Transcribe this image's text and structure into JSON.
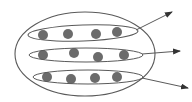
{
  "diagram": {
    "colors": {
      "background": "#ffffff",
      "stroke": "#5a5a5a",
      "dot": "#6b6b6b"
    },
    "outer_ellipse": {
      "cx": 85,
      "cy": 54,
      "rx": 70,
      "ry": 42
    },
    "groups": [
      {
        "ellipse": {
          "cx": 83,
          "cy": 33,
          "rx": 55,
          "ry": 8,
          "rotate": -2
        },
        "dots": [
          {
            "x": 43,
            "y": 35
          },
          {
            "x": 68,
            "y": 34
          },
          {
            "x": 96,
            "y": 34
          },
          {
            "x": 117,
            "y": 32
          }
        ],
        "arrow": {
          "x1": 136,
          "y1": 30,
          "x2": 172,
          "y2": 12
        }
      },
      {
        "ellipse": {
          "cx": 86,
          "cy": 55,
          "rx": 57,
          "ry": 7,
          "rotate": 0
        },
        "dots": [
          {
            "x": 43,
            "y": 55
          },
          {
            "x": 74,
            "y": 53
          },
          {
            "x": 98,
            "y": 57
          },
          {
            "x": 124,
            "y": 55
          }
        ],
        "arrow": {
          "x1": 142,
          "y1": 54,
          "x2": 180,
          "y2": 51
        }
      },
      {
        "ellipse": {
          "cx": 88,
          "cy": 77,
          "rx": 55,
          "ry": 7,
          "rotate": 0
        },
        "dots": [
          {
            "x": 47,
            "y": 77
          },
          {
            "x": 71,
            "y": 79
          },
          {
            "x": 95,
            "y": 78
          },
          {
            "x": 117,
            "y": 77
          }
        ],
        "arrow": {
          "x1": 142,
          "y1": 78,
          "x2": 188,
          "y2": 88
        }
      }
    ],
    "dot_radius": 5
  }
}
